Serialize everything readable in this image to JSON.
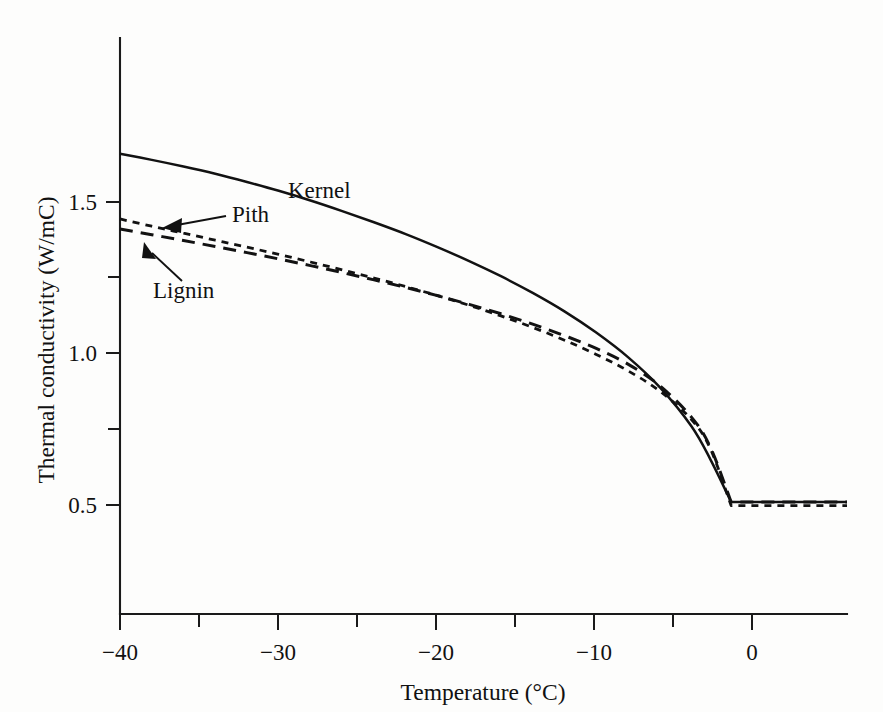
{
  "figure": {
    "background_color": "#fdfdfc",
    "ink_color": "#121212"
  },
  "axes": {
    "x_title": "Temperature (°C)",
    "y_title": "Thermal conductivity (W/mC)",
    "x_ticks": [
      "−40",
      "−30",
      "−20",
      "−10",
      "0"
    ],
    "y_ticks": [
      "1.5",
      "1.0",
      "0.5"
    ]
  },
  "annotations": {
    "kernel_label": "Kernel",
    "pith_label": "Pith",
    "lignin_label": "Lignin"
  },
  "chart_data": {
    "type": "line",
    "title": "",
    "xlabel": "Temperature (°C)",
    "ylabel": "Thermal conductivity (W/mC)",
    "xlim": [
      -40,
      5.8
    ],
    "ylim": [
      0.29,
      1.91
    ],
    "x_ticks_major": [
      -40,
      -30,
      -20,
      -10,
      0
    ],
    "x_ticks_minor": [
      -35,
      -25,
      -15,
      -5
    ],
    "y_ticks_major": [
      1.5,
      1.0,
      0.5
    ],
    "y_ticks_minor": [
      1.25,
      0.75
    ],
    "grid": false,
    "legend": "inline-annotations",
    "series": [
      {
        "name": "Kernel",
        "style": "solid",
        "x": [
          -40,
          -38,
          -36,
          -34,
          -32,
          -30,
          -28,
          -26,
          -24,
          -22,
          -20,
          -18,
          -16,
          -14,
          -12,
          -10,
          -8,
          -6,
          -4,
          -2.8,
          -1.5,
          0,
          2,
          5.8
        ],
        "y": [
          1.659,
          1.639,
          1.617,
          1.593,
          1.566,
          1.537,
          1.505,
          1.47,
          1.433,
          1.394,
          1.351,
          1.305,
          1.255,
          1.2,
          1.139,
          1.069,
          0.988,
          0.889,
          0.76,
          0.65,
          0.51,
          0.51,
          0.51,
          0.51
        ]
      },
      {
        "name": "Lignin",
        "style": "long-dash",
        "x": [
          -40,
          -38,
          -36,
          -34,
          -32,
          -30,
          -28,
          -26,
          -24,
          -22,
          -20,
          -18,
          -16,
          -14,
          -12,
          -10,
          -8,
          -6,
          -4,
          -2.8,
          -1.5,
          0,
          2,
          5.8
        ],
        "y": [
          1.411,
          1.392,
          1.373,
          1.353,
          1.333,
          1.312,
          1.29,
          1.267,
          1.243,
          1.218,
          1.191,
          1.162,
          1.131,
          1.097,
          1.059,
          1.017,
          0.965,
          0.894,
          0.79,
          0.69,
          0.51,
          0.51,
          0.51,
          0.51
        ]
      },
      {
        "name": "Pith",
        "style": "short-dash",
        "x": [
          -40,
          -38,
          -36,
          -34,
          -32,
          -30,
          -28,
          -26,
          -24,
          -22,
          -20,
          -18,
          -16,
          -14,
          -12,
          -10,
          -8,
          -6,
          -4,
          -2.8,
          -1.5,
          0,
          2,
          5.8
        ],
        "y": [
          1.444,
          1.42,
          1.397,
          1.374,
          1.351,
          1.327,
          1.302,
          1.276,
          1.249,
          1.221,
          1.191,
          1.159,
          1.124,
          1.086,
          1.044,
          0.997,
          0.943,
          0.876,
          0.782,
          0.685,
          0.498,
          0.498,
          0.498,
          0.498
        ]
      }
    ]
  }
}
